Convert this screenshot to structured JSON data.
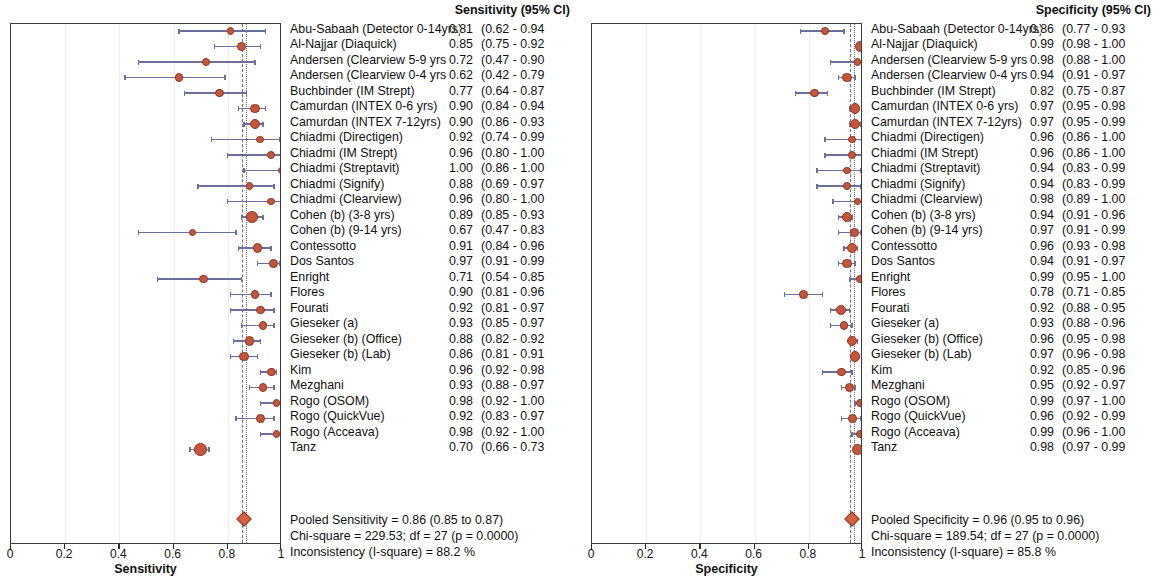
{
  "figure": {
    "type": "forest-plot-pair",
    "width": 1162,
    "height": 577,
    "marker_color": "#c4563c",
    "marker_edge_color": "#8e3526",
    "ci_line_color": "#6b6f9c",
    "axis_color": "#3b3b3b"
  },
  "panels": [
    {
      "id": "sensitivity",
      "column_header": "Sensitivity (95% CI)",
      "axis_title": "Sensitivity",
      "axis_ticks": [
        "0",
        "0.2",
        "0.4",
        "0.6",
        "0.8",
        "1"
      ],
      "axis_tick_values": [
        0,
        0.2,
        0.4,
        0.6,
        0.8,
        1
      ],
      "pooled_line_value": 0.86,
      "pooled_diamond": {
        "value": 0.86,
        "low": 0.85,
        "high": 0.87
      },
      "footer": [
        "Pooled Sensitivity = 0.86 (0.85 to 0.87)",
        "Chi-square = 229.53; df =  27 (p = 0.0000)",
        "Inconsistency (I-square) = 88.2 %"
      ],
      "rows": [
        {
          "study": "Abu-Sabaah (Detector 0-14yrs)",
          "est": "0.81",
          "ci": "(0.62 - 0.94",
          "value": 0.81,
          "low": 0.62,
          "high": 0.94,
          "weight": 4
        },
        {
          "study": "Al-Najjar (Diaquick)",
          "est": "0.85",
          "ci": "(0.75 - 0.92",
          "value": 0.85,
          "low": 0.75,
          "high": 0.92,
          "weight": 6
        },
        {
          "study": "Andersen (Clearview 5-9 yrs",
          "est": "0.72",
          "ci": "(0.47 - 0.90",
          "value": 0.72,
          "low": 0.47,
          "high": 0.9,
          "weight": 4
        },
        {
          "study": "Andersen (Clearview 0-4 yrs",
          "est": "0.62",
          "ci": "(0.42 - 0.79",
          "value": 0.62,
          "low": 0.42,
          "high": 0.79,
          "weight": 5
        },
        {
          "study": "Buchbinder (IM Strept)",
          "est": "0.77",
          "ci": "(0.64 - 0.87",
          "value": 0.77,
          "low": 0.64,
          "high": 0.87,
          "weight": 5
        },
        {
          "study": "Camurdan (INTEX 0-6 yrs)",
          "est": "0.90",
          "ci": "(0.84 - 0.94",
          "value": 0.9,
          "low": 0.84,
          "high": 0.94,
          "weight": 6
        },
        {
          "study": "Camurdan (INTEX 7-12yrs)",
          "est": "0.90",
          "ci": "(0.86 - 0.93",
          "value": 0.9,
          "low": 0.86,
          "high": 0.93,
          "weight": 7
        },
        {
          "study": "Chiadmi (Directigen)",
          "est": "0.92",
          "ci": "(0.74 - 0.99",
          "value": 0.92,
          "low": 0.74,
          "high": 0.99,
          "weight": 4
        },
        {
          "study": "Chiadmi (IM Strept)",
          "est": "0.96",
          "ci": "(0.80 - 1.00",
          "value": 0.96,
          "low": 0.8,
          "high": 1.0,
          "weight": 4
        },
        {
          "study": "Chiadmi (Streptavit)",
          "est": "1.00",
          "ci": "(0.86 - 1.00",
          "value": 1.0,
          "low": 0.86,
          "high": 1.0,
          "weight": 4
        },
        {
          "study": "Chiadmi (Signify)",
          "est": "0.88",
          "ci": "(0.69 - 0.97",
          "value": 0.88,
          "low": 0.69,
          "high": 0.97,
          "weight": 4
        },
        {
          "study": "Chiadmi (Clearview)",
          "est": "0.96",
          "ci": "(0.80 - 1.00",
          "value": 0.96,
          "low": 0.8,
          "high": 1.0,
          "weight": 4
        },
        {
          "study": "Cohen (b) (3-8 yrs)",
          "est": "0.89",
          "ci": "(0.85 - 0.93",
          "value": 0.89,
          "low": 0.85,
          "high": 0.93,
          "weight": 8
        },
        {
          "study": "Cohen (b) (9-14 yrs)",
          "est": "0.67",
          "ci": "(0.47 - 0.83",
          "value": 0.67,
          "low": 0.47,
          "high": 0.83,
          "weight": 4
        },
        {
          "study": "Contessotto",
          "est": "0.91",
          "ci": "(0.84 - 0.96",
          "value": 0.91,
          "low": 0.84,
          "high": 0.96,
          "weight": 6
        },
        {
          "study": "Dos Santos",
          "est": "0.97",
          "ci": "(0.91 - 0.99",
          "value": 0.97,
          "low": 0.91,
          "high": 0.99,
          "weight": 5
        },
        {
          "study": "Enright",
          "est": "0.71",
          "ci": "(0.54 - 0.85",
          "value": 0.71,
          "low": 0.54,
          "high": 0.85,
          "weight": 5
        },
        {
          "study": "Flores",
          "est": "0.90",
          "ci": "(0.81 - 0.96",
          "value": 0.9,
          "low": 0.81,
          "high": 0.96,
          "weight": 5
        },
        {
          "study": "Fourati",
          "est": "0.92",
          "ci": "(0.81 - 0.97",
          "value": 0.92,
          "low": 0.81,
          "high": 0.97,
          "weight": 5
        },
        {
          "study": "Gieseker (a)",
          "est": "0.93",
          "ci": "(0.85 - 0.97",
          "value": 0.93,
          "low": 0.85,
          "high": 0.97,
          "weight": 5
        },
        {
          "study": "Gieseker (b) (Office)",
          "est": "0.88",
          "ci": "(0.82 - 0.92",
          "value": 0.88,
          "low": 0.82,
          "high": 0.92,
          "weight": 6
        },
        {
          "study": "Gieseker (b) (Lab)",
          "est": "0.86",
          "ci": "(0.81 - 0.91",
          "value": 0.86,
          "low": 0.81,
          "high": 0.91,
          "weight": 6
        },
        {
          "study": "Kim",
          "est": "0.96",
          "ci": "(0.92 - 0.98",
          "value": 0.96,
          "low": 0.92,
          "high": 0.98,
          "weight": 5
        },
        {
          "study": "Mezghani",
          "est": "0.93",
          "ci": "(0.88 - 0.97",
          "value": 0.93,
          "low": 0.88,
          "high": 0.97,
          "weight": 5
        },
        {
          "study": "Rogo (OSOM)",
          "est": "0.98",
          "ci": "(0.92 - 1.00",
          "value": 0.98,
          "low": 0.92,
          "high": 1.0,
          "weight": 4
        },
        {
          "study": "Rogo (QuickVue)",
          "est": "0.92",
          "ci": "(0.83 - 0.97",
          "value": 0.92,
          "low": 0.83,
          "high": 0.97,
          "weight": 5
        },
        {
          "study": "Rogo (Acceava)",
          "est": "0.98",
          "ci": "(0.92 - 1.00",
          "value": 0.98,
          "low": 0.92,
          "high": 1.0,
          "weight": 4
        },
        {
          "study": "Tanz",
          "est": "0.70",
          "ci": "(0.66 - 0.73",
          "value": 0.7,
          "low": 0.66,
          "high": 0.73,
          "weight": 9
        }
      ]
    },
    {
      "id": "specificity",
      "column_header": "Specificity (95% CI)",
      "axis_title": "Specificity",
      "axis_ticks": [
        "0",
        "0.2",
        "0.4",
        "0.6",
        "0.8",
        "1"
      ],
      "axis_tick_values": [
        0,
        0.2,
        0.4,
        0.6,
        0.8,
        1
      ],
      "pooled_line_value": 0.96,
      "pooled_diamond": {
        "value": 0.96,
        "low": 0.95,
        "high": 0.96
      },
      "footer": [
        "Pooled Specificity = 0.96 (0.95 to 0.96)",
        "Chi-square = 189.54; df =  27 (p = 0.0000)",
        "Inconsistency (I-square) = 85.8 %"
      ],
      "rows": [
        {
          "study": "Abu-Sabaah (Detector 0-14yrs)",
          "est": "0.86",
          "ci": "(0.77 - 0.93",
          "value": 0.86,
          "low": 0.77,
          "high": 0.93,
          "weight": 5
        },
        {
          "study": "Al-Najjar (Diaquick)",
          "est": "0.99",
          "ci": "(0.98 - 1.00",
          "value": 0.99,
          "low": 0.98,
          "high": 1.0,
          "weight": 7
        },
        {
          "study": "Andersen (Clearview 5-9 yrs",
          "est": "0.98",
          "ci": "(0.88 - 1.00",
          "value": 0.98,
          "low": 0.88,
          "high": 1.0,
          "weight": 4
        },
        {
          "study": "Andersen (Clearview 0-4 yrs",
          "est": "0.94",
          "ci": "(0.91 - 0.97",
          "value": 0.94,
          "low": 0.91,
          "high": 0.97,
          "weight": 6
        },
        {
          "study": "Buchbinder (IM Strept)",
          "est": "0.82",
          "ci": "(0.75 - 0.87",
          "value": 0.82,
          "low": 0.75,
          "high": 0.87,
          "weight": 5
        },
        {
          "study": "Camurdan (INTEX 0-6 yrs)",
          "est": "0.97",
          "ci": "(0.95 - 0.98",
          "value": 0.97,
          "low": 0.95,
          "high": 0.98,
          "weight": 7
        },
        {
          "study": "Camurdan (INTEX 7-12yrs)",
          "est": "0.97",
          "ci": "(0.95 - 0.99",
          "value": 0.97,
          "low": 0.95,
          "high": 0.99,
          "weight": 6
        },
        {
          "study": "Chiadmi (Directigen)",
          "est": "0.96",
          "ci": "(0.86 - 1.00",
          "value": 0.96,
          "low": 0.86,
          "high": 1.0,
          "weight": 4
        },
        {
          "study": "Chiadmi (IM Strept)",
          "est": "0.96",
          "ci": "(0.86 - 1.00",
          "value": 0.96,
          "low": 0.86,
          "high": 1.0,
          "weight": 4
        },
        {
          "study": "Chiadmi (Streptavit)",
          "est": "0.94",
          "ci": "(0.83 - 0.99",
          "value": 0.94,
          "low": 0.83,
          "high": 0.99,
          "weight": 4
        },
        {
          "study": "Chiadmi (Signify)",
          "est": "0.94",
          "ci": "(0.83 - 0.99",
          "value": 0.94,
          "low": 0.83,
          "high": 0.99,
          "weight": 4
        },
        {
          "study": "Chiadmi (Clearview)",
          "est": "0.98",
          "ci": "(0.89 - 1.00",
          "value": 0.98,
          "low": 0.89,
          "high": 1.0,
          "weight": 4
        },
        {
          "study": "Cohen (b) (3-8 yrs)",
          "est": "0.94",
          "ci": "(0.91 - 0.96",
          "value": 0.94,
          "low": 0.91,
          "high": 0.96,
          "weight": 6
        },
        {
          "study": "Cohen (b) (9-14 yrs)",
          "est": "0.97",
          "ci": "(0.91 - 0.99",
          "value": 0.97,
          "low": 0.91,
          "high": 0.99,
          "weight": 5
        },
        {
          "study": "Contessotto",
          "est": "0.96",
          "ci": "(0.93 - 0.98",
          "value": 0.96,
          "low": 0.93,
          "high": 0.98,
          "weight": 6
        },
        {
          "study": "Dos Santos",
          "est": "0.94",
          "ci": "(0.91 - 0.97",
          "value": 0.94,
          "low": 0.91,
          "high": 0.97,
          "weight": 6
        },
        {
          "study": "Enright",
          "est": "0.99",
          "ci": "(0.95 - 1.00",
          "value": 0.99,
          "low": 0.95,
          "high": 1.0,
          "weight": 4
        },
        {
          "study": "Flores",
          "est": "0.78",
          "ci": "(0.71 - 0.85",
          "value": 0.78,
          "low": 0.71,
          "high": 0.85,
          "weight": 5
        },
        {
          "study": "Fourati",
          "est": "0.92",
          "ci": "(0.88 - 0.95",
          "value": 0.92,
          "low": 0.88,
          "high": 0.95,
          "weight": 6
        },
        {
          "study": "Gieseker (a)",
          "est": "0.93",
          "ci": "(0.88 - 0.96",
          "value": 0.93,
          "low": 0.88,
          "high": 0.96,
          "weight": 5
        },
        {
          "study": "Gieseker (b) (Office)",
          "est": "0.96",
          "ci": "(0.95 - 0.98",
          "value": 0.96,
          "low": 0.95,
          "high": 0.98,
          "weight": 7
        },
        {
          "study": "Gieseker (b) (Lab)",
          "est": "0.97",
          "ci": "(0.96 - 0.98",
          "value": 0.97,
          "low": 0.96,
          "high": 0.98,
          "weight": 7
        },
        {
          "study": "Kim",
          "est": "0.92",
          "ci": "(0.85 - 0.96",
          "value": 0.92,
          "low": 0.85,
          "high": 0.96,
          "weight": 5
        },
        {
          "study": "Mezghani",
          "est": "0.95",
          "ci": "(0.92 - 0.97",
          "value": 0.95,
          "low": 0.92,
          "high": 0.97,
          "weight": 6
        },
        {
          "study": "Rogo (OSOM)",
          "est": "0.99",
          "ci": "(0.97 - 1.00",
          "value": 0.99,
          "low": 0.97,
          "high": 1.0,
          "weight": 5
        },
        {
          "study": "Rogo (QuickVue)",
          "est": "0.96",
          "ci": "(0.92 - 0.99",
          "value": 0.96,
          "low": 0.92,
          "high": 0.99,
          "weight": 5
        },
        {
          "study": "Rogo (Acceava)",
          "est": "0.99",
          "ci": "(0.96 - 1.00",
          "value": 0.99,
          "low": 0.96,
          "high": 1.0,
          "weight": 5
        },
        {
          "study": "Tanz",
          "est": "0.98",
          "ci": "(0.97 - 0.99",
          "value": 0.98,
          "low": 0.97,
          "high": 0.99,
          "weight": 8
        }
      ]
    }
  ],
  "chart_data": {
    "type": "forest",
    "title": "",
    "n_studies": 28,
    "xlabels": [
      "Sensitivity",
      "Specificity"
    ],
    "xlim": [
      0,
      1
    ],
    "grid": true,
    "legend": "none",
    "series": [
      {
        "name": "Sensitivity",
        "categories": [
          "Abu-Sabaah (Detector 0-14yrs)",
          "Al-Najjar (Diaquick)",
          "Andersen (Clearview 5-9 yrs",
          "Andersen (Clearview 0-4 yrs",
          "Buchbinder (IM Strept)",
          "Camurdan (INTEX 0-6 yrs)",
          "Camurdan (INTEX 7-12yrs)",
          "Chiadmi (Directigen)",
          "Chiadmi (IM Strept)",
          "Chiadmi (Streptavit)",
          "Chiadmi (Signify)",
          "Chiadmi (Clearview)",
          "Cohen (b) (3-8 yrs)",
          "Cohen (b) (9-14 yrs)",
          "Contessotto",
          "Dos Santos",
          "Enright",
          "Flores",
          "Fourati",
          "Gieseker (a)",
          "Gieseker (b) (Office)",
          "Gieseker (b) (Lab)",
          "Kim",
          "Mezghani",
          "Rogo (OSOM)",
          "Rogo (QuickVue)",
          "Rogo (Acceava)",
          "Tanz"
        ],
        "values": [
          0.81,
          0.85,
          0.72,
          0.62,
          0.77,
          0.9,
          0.9,
          0.92,
          0.96,
          1.0,
          0.88,
          0.96,
          0.89,
          0.67,
          0.91,
          0.97,
          0.71,
          0.9,
          0.92,
          0.93,
          0.88,
          0.86,
          0.96,
          0.93,
          0.98,
          0.92,
          0.98,
          0.7
        ],
        "ci_low": [
          0.62,
          0.75,
          0.47,
          0.42,
          0.64,
          0.84,
          0.86,
          0.74,
          0.8,
          0.86,
          0.69,
          0.8,
          0.85,
          0.47,
          0.84,
          0.91,
          0.54,
          0.81,
          0.81,
          0.85,
          0.82,
          0.81,
          0.92,
          0.88,
          0.92,
          0.83,
          0.92,
          0.66
        ],
        "ci_high": [
          0.94,
          0.92,
          0.9,
          0.79,
          0.87,
          0.94,
          0.93,
          0.99,
          1.0,
          1.0,
          0.97,
          1.0,
          0.93,
          0.83,
          0.96,
          0.99,
          0.85,
          0.96,
          0.97,
          0.97,
          0.92,
          0.91,
          0.98,
          0.97,
          1.0,
          0.97,
          1.0,
          0.73
        ],
        "pooled": 0.86,
        "pooled_low": 0.85,
        "pooled_high": 0.87,
        "chi_square": 229.53,
        "df": 27,
        "p": 0.0,
        "i_square": "88.2 %"
      },
      {
        "name": "Specificity",
        "categories": [
          "Abu-Sabaah (Detector 0-14yrs)",
          "Al-Najjar (Diaquick)",
          "Andersen (Clearview 5-9 yrs",
          "Andersen (Clearview 0-4 yrs",
          "Buchbinder (IM Strept)",
          "Camurdan (INTEX 0-6 yrs)",
          "Camurdan (INTEX 7-12yrs)",
          "Chiadmi (Directigen)",
          "Chiadmi (IM Strept)",
          "Chiadmi (Streptavit)",
          "Chiadmi (Signify)",
          "Chiadmi (Clearview)",
          "Cohen (b) (3-8 yrs)",
          "Cohen (b) (9-14 yrs)",
          "Contessotto",
          "Dos Santos",
          "Enright",
          "Flores",
          "Fourati",
          "Gieseker (a)",
          "Gieseker (b) (Office)",
          "Gieseker (b) (Lab)",
          "Kim",
          "Mezghani",
          "Rogo (OSOM)",
          "Rogo (QuickVue)",
          "Rogo (Acceava)",
          "Tanz"
        ],
        "values": [
          0.86,
          0.99,
          0.98,
          0.94,
          0.82,
          0.97,
          0.97,
          0.96,
          0.96,
          0.94,
          0.94,
          0.98,
          0.94,
          0.97,
          0.96,
          0.94,
          0.99,
          0.78,
          0.92,
          0.93,
          0.96,
          0.97,
          0.92,
          0.95,
          0.99,
          0.96,
          0.99,
          0.98
        ],
        "ci_low": [
          0.77,
          0.98,
          0.88,
          0.91,
          0.75,
          0.95,
          0.95,
          0.86,
          0.86,
          0.83,
          0.83,
          0.89,
          0.91,
          0.91,
          0.93,
          0.91,
          0.95,
          0.71,
          0.88,
          0.88,
          0.95,
          0.96,
          0.85,
          0.92,
          0.97,
          0.92,
          0.96,
          0.97
        ],
        "ci_high": [
          0.93,
          1.0,
          1.0,
          0.97,
          0.87,
          0.98,
          0.99,
          1.0,
          1.0,
          0.99,
          0.99,
          1.0,
          0.96,
          0.99,
          0.98,
          0.97,
          1.0,
          0.85,
          0.95,
          0.96,
          0.98,
          0.98,
          0.96,
          0.97,
          1.0,
          0.99,
          1.0,
          0.99
        ],
        "pooled": 0.96,
        "pooled_low": 0.95,
        "pooled_high": 0.96,
        "chi_square": 189.54,
        "df": 27,
        "p": 0.0,
        "i_square": "85.8 %"
      }
    ]
  }
}
